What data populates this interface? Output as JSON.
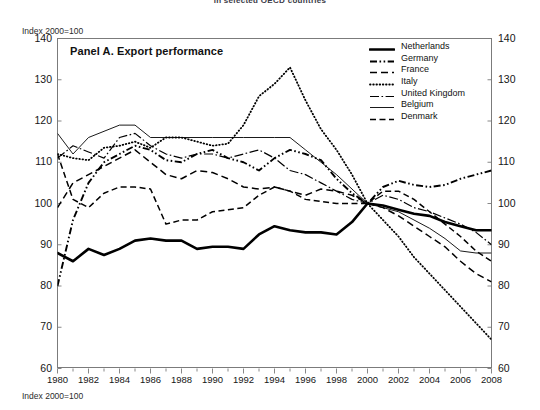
{
  "figure": {
    "top_title": "in selected OECD countries",
    "index_note_top": "Index 2000=100",
    "index_note_bottom": "Index 2000=100",
    "panel_title": "Panel A. Export performance"
  },
  "legend": {
    "items": [
      {
        "label": "Netherlands",
        "style": "thick-solid"
      },
      {
        "label": "Germany",
        "style": "dash-dot-dot"
      },
      {
        "label": "France",
        "style": "long-dash"
      },
      {
        "label": "Italy",
        "style": "dotted"
      },
      {
        "label": "United Kingdom",
        "style": "dash-dot"
      },
      {
        "label": "Belgium",
        "style": "thin-solid"
      },
      {
        "label": "Denmark",
        "style": "dashed"
      }
    ]
  },
  "axes": {
    "y_ticks": [
      60,
      70,
      80,
      90,
      100,
      110,
      120,
      130,
      140
    ],
    "x_ticks": [
      1980,
      1982,
      1984,
      1986,
      1988,
      1990,
      1992,
      1994,
      1996,
      1998,
      2000,
      2002,
      2004,
      2006,
      2008
    ]
  },
  "chart_data": {
    "type": "line",
    "title": "Panel A. Export performance",
    "subtitle": "in selected OECD countries",
    "xlabel": "",
    "ylabel": "Index 2000=100",
    "xlim": [
      1980,
      2008
    ],
    "ylim": [
      60,
      140
    ],
    "grid": false,
    "legend_position": "top-right",
    "x": [
      1980,
      1981,
      1982,
      1983,
      1984,
      1985,
      1986,
      1987,
      1988,
      1989,
      1990,
      1991,
      1992,
      1993,
      1994,
      1995,
      1996,
      1997,
      1998,
      1999,
      2000,
      2001,
      2002,
      2003,
      2004,
      2005,
      2006,
      2007,
      2008
    ],
    "series": [
      {
        "name": "Netherlands",
        "style": "thick-solid",
        "values": [
          88,
          86,
          89,
          87.5,
          89,
          91,
          91.5,
          91,
          91,
          89,
          89.5,
          89.5,
          89,
          92.5,
          94.5,
          93.5,
          93,
          93,
          92.5,
          95.5,
          100,
          99.5,
          98.5,
          97.5,
          97,
          95.5,
          94.5,
          93.5,
          93.5
        ]
      },
      {
        "name": "Germany",
        "style": "dash-dot-dot",
        "values": [
          80,
          96,
          105,
          110,
          112,
          114,
          113,
          110.5,
          110,
          112,
          113,
          111,
          110,
          108,
          111,
          113,
          112,
          110.5,
          106,
          102.5,
          100,
          104,
          105.5,
          104.5,
          104,
          104.5,
          106,
          107,
          108
        ]
      },
      {
        "name": "France",
        "style": "long-dash",
        "values": [
          99,
          105,
          107,
          109,
          111,
          113,
          110,
          107,
          106,
          108,
          107.5,
          106,
          104,
          103.5,
          104,
          103,
          102,
          103.5,
          103,
          102,
          100,
          99,
          97,
          94.5,
          92,
          89.5,
          86,
          83,
          81
        ]
      },
      {
        "name": "Italy",
        "style": "dotted",
        "values": [
          112,
          111,
          110.5,
          113.5,
          114,
          115,
          113.5,
          116,
          116,
          115,
          114,
          114.5,
          119,
          126,
          129,
          133,
          125,
          118,
          113,
          107,
          100,
          96,
          92,
          87,
          83,
          79,
          75,
          71,
          67
        ]
      },
      {
        "name": "United Kingdom",
        "style": "dash-dot",
        "values": [
          111,
          114,
          112.5,
          111,
          116,
          117,
          114,
          112,
          111,
          112,
          112,
          111,
          112,
          113,
          111,
          108,
          107,
          105,
          103,
          101,
          100,
          102,
          101,
          99,
          98,
          96.5,
          95,
          93,
          90
        ]
      },
      {
        "name": "Belgium",
        "style": "thin-solid",
        "values": [
          117,
          112,
          116,
          117.5,
          119,
          119,
          116,
          116,
          116,
          116,
          116,
          116,
          116,
          116,
          116,
          116,
          113,
          110,
          107,
          103.5,
          100,
          99,
          98,
          96,
          94,
          91.5,
          88.5,
          88,
          88
        ]
      },
      {
        "name": "Denmark",
        "style": "dashed",
        "values": [
          112,
          101,
          99,
          102.5,
          104,
          104,
          103.5,
          95,
          96,
          96,
          98,
          98.5,
          99,
          102,
          104,
          103,
          101,
          100.5,
          100,
          100,
          100,
          103,
          103,
          101,
          98,
          95,
          92,
          88.5,
          86
        ]
      }
    ]
  }
}
